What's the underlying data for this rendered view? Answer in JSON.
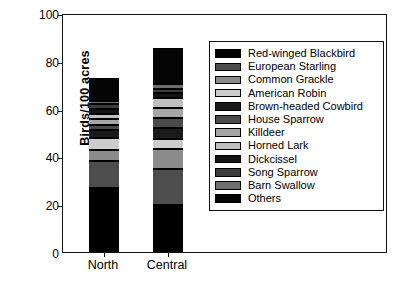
{
  "caption_sliver": "",
  "axes": {
    "ylabel": "Birds/100 acres",
    "yticks": [
      0,
      20,
      40,
      60,
      80,
      100
    ],
    "ymin": 0,
    "ymax": 100,
    "xlabels": [
      "North",
      "Central"
    ]
  },
  "chart_data": {
    "type": "bar",
    "subtype": "stacked-bar",
    "title": "",
    "xlabel": "",
    "ylabel": "Birds/100 acres",
    "ylim": [
      0,
      100
    ],
    "yticks": [
      0,
      20,
      40,
      60,
      80,
      100
    ],
    "grid": false,
    "legend_position": "inside-right",
    "categories": [
      "North",
      "Central"
    ],
    "totals": [
      73.0,
      85.6
    ],
    "series": [
      {
        "name": "Red-winged Blackbird",
        "color": "#000000",
        "values": [
          26.6,
          19.7
        ]
      },
      {
        "name": "European Starling",
        "color": "#4d4d4d",
        "values": [
          11.3,
          15.2
        ]
      },
      {
        "name": "Common Grackle",
        "color": "#8c8c8c",
        "values": [
          4.7,
          8.1
        ]
      },
      {
        "name": "American Robin",
        "color": "#cccccc",
        "values": [
          5.0,
          4.5
        ]
      },
      {
        "name": "Brown-headed Cowbird",
        "color": "#1a1a1a",
        "values": [
          3.3,
          4.6
        ]
      },
      {
        "name": "House Sparrow",
        "color": "#4a4a4a",
        "values": [
          2.1,
          4.0
        ]
      },
      {
        "name": "Killdeer",
        "color": "#a6a6a6",
        "values": [
          2.6,
          4.2
        ]
      },
      {
        "name": "Horned Lark",
        "color": "#bfbfbf",
        "values": [
          2.0,
          4.0
        ]
      },
      {
        "name": "Dickcissel",
        "color": "#141414",
        "values": [
          2.2,
          2.4
        ]
      },
      {
        "name": "Song Sparrow",
        "color": "#3d3d3d",
        "values": [
          2.0,
          1.4
        ]
      },
      {
        "name": "Barn Swallow",
        "color": "#6e6e6e",
        "values": [
          1.6,
          2.3
        ]
      },
      {
        "name": "Others",
        "color": "#050505",
        "values": [
          9.6,
          15.2
        ]
      }
    ]
  }
}
